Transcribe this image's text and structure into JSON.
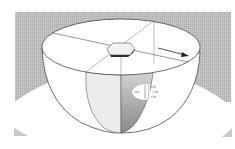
{
  "diagram": {
    "colors": {
      "background_band": "#b8b8b8",
      "white": "#ffffff",
      "outline": "#333333",
      "light_segment": "#e6e6e6",
      "dark_segment": "#9a9a9a",
      "block": "#555555"
    },
    "labels": {
      "left": "CM",
      "right_top": "CM",
      "right_mid": "CM",
      "right_bottom": "CM"
    },
    "arrow": {
      "direction": "right-down"
    }
  }
}
